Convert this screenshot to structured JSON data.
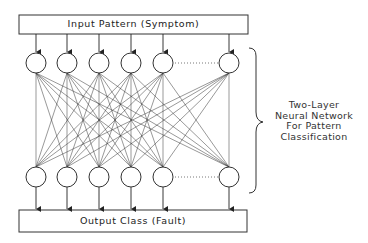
{
  "diagram": {
    "input_box": {
      "label": "Input Pattern (Symptom)"
    },
    "output_box": {
      "label": "Output Class (Fault)"
    },
    "annotation": {
      "lines": [
        "Two-Layer",
        "Neural Network",
        "For Pattern",
        "Classification"
      ]
    },
    "layers": {
      "top_nodes": 6,
      "bottom_nodes": 6,
      "ellipsis_between_last_two": true,
      "connectivity": "fully-connected"
    },
    "colors": {
      "stroke": "#222222",
      "background": "#ffffff",
      "text": "#222222"
    }
  }
}
